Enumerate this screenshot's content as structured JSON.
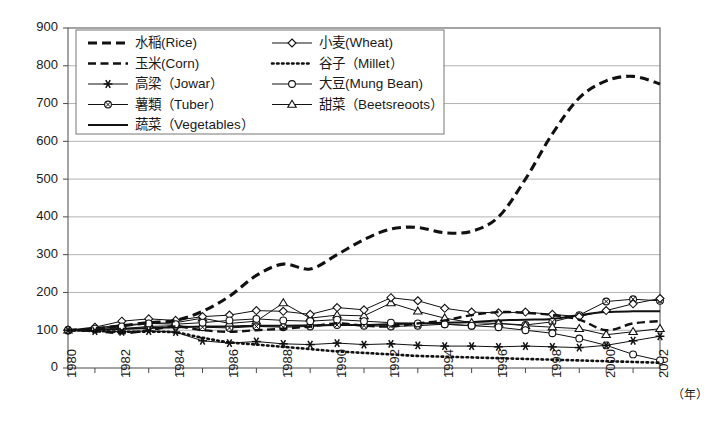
{
  "chart_data": {
    "type": "line",
    "title": "",
    "subtitle": "",
    "xlabel": "年",
    "ylabel": "",
    "xlim": [
      1980,
      2002
    ],
    "ylim": [
      0,
      900
    ],
    "grid": true,
    "legend_position": "top-left-inside",
    "x": [
      1980,
      1981,
      1982,
      1983,
      1984,
      1985,
      1986,
      1987,
      1988,
      1989,
      1990,
      1991,
      1992,
      1993,
      1994,
      1995,
      1996,
      1997,
      1998,
      1999,
      2000,
      2001,
      2002
    ],
    "x_tick_labels": [
      "1980",
      "1982",
      "1984",
      "1986",
      "1988",
      "1990",
      "1992",
      "1994",
      "1996",
      "1998",
      "2000",
      "2002"
    ],
    "y_tick_labels": [
      "0",
      "100",
      "200",
      "300",
      "400",
      "500",
      "600",
      "700",
      "800",
      "900"
    ],
    "series": [
      {
        "name": "水稲(Rice)",
        "key": "rice",
        "style": "dashed-thick",
        "marker": "none",
        "values": [
          100,
          104,
          112,
          120,
          126,
          150,
          190,
          245,
          275,
          262,
          300,
          340,
          368,
          372,
          358,
          362,
          400,
          500,
          620,
          715,
          760,
          772,
          752
        ]
      },
      {
        "name": "玉米(Corn)",
        "key": "corn",
        "style": "dashed-medium",
        "marker": "none",
        "values": [
          100,
          98,
          92,
          100,
          110,
          100,
          96,
          100,
          104,
          110,
          118,
          112,
          110,
          118,
          126,
          140,
          148,
          146,
          140,
          128,
          100,
          118,
          124
        ]
      },
      {
        "name": "高梁（Jowar）",
        "key": "jowar",
        "style": "solid-thin",
        "marker": "star",
        "values": [
          100,
          98,
          96,
          98,
          95,
          72,
          66,
          70,
          64,
          62,
          66,
          62,
          64,
          60,
          58,
          58,
          56,
          58,
          56,
          54,
          60,
          72,
          84
        ]
      },
      {
        "name": "薯類（Tuber）",
        "key": "tuber",
        "style": "solid-thin",
        "marker": "circle-x",
        "values": [
          100,
          102,
          104,
          110,
          112,
          108,
          106,
          110,
          108,
          110,
          114,
          112,
          110,
          112,
          116,
          112,
          118,
          114,
          122,
          140,
          176,
          182,
          178
        ]
      },
      {
        "name": "蔬菜（Vegetables）",
        "key": "vegetables",
        "style": "solid-medium",
        "marker": "none",
        "values": [
          100,
          101,
          103,
          106,
          108,
          110,
          110,
          112,
          112,
          113,
          114,
          114,
          116,
          118,
          120,
          122,
          126,
          128,
          130,
          140,
          148,
          150,
          150
        ]
      },
      {
        "name": "小麦(Wheat)",
        "key": "wheat",
        "style": "solid-thin",
        "marker": "diamond",
        "values": [
          100,
          108,
          124,
          130,
          126,
          136,
          140,
          152,
          150,
          142,
          160,
          154,
          186,
          178,
          158,
          148,
          146,
          148,
          142,
          136,
          152,
          170,
          184
        ]
      },
      {
        "name": "谷子（Millet）",
        "key": "millet",
        "style": "dotted",
        "marker": "none",
        "values": [
          100,
          98,
          96,
          96,
          94,
          80,
          68,
          62,
          56,
          50,
          44,
          40,
          36,
          32,
          30,
          28,
          26,
          24,
          22,
          20,
          18,
          16,
          14
        ]
      },
      {
        "name": "大豆(Mung Bean)",
        "key": "mungbean",
        "style": "solid-thin",
        "marker": "circle",
        "values": [
          100,
          104,
          110,
          118,
          116,
          120,
          126,
          130,
          126,
          124,
          128,
          124,
          120,
          118,
          116,
          112,
          108,
          100,
          92,
          78,
          60,
          36,
          20
        ]
      },
      {
        "name": "甜菜（Beetsreoots）",
        "key": "beetroots",
        "style": "solid-thin",
        "marker": "triangle",
        "values": [
          100,
          106,
          114,
          118,
          120,
          132,
          118,
          124,
          172,
          132,
          140,
          138,
          172,
          150,
          132,
          120,
          118,
          112,
          108,
          104,
          88,
          96,
          104
        ]
      }
    ]
  },
  "legend": {
    "entries": [
      {
        "label": "水稲(Rice)",
        "key": "rice"
      },
      {
        "label": "小麦(Wheat)",
        "key": "wheat"
      },
      {
        "label": "玉米(Corn)",
        "key": "corn"
      },
      {
        "label": "谷子（Millet）",
        "key": "millet"
      },
      {
        "label": "高梁（Jowar）",
        "key": "jowar"
      },
      {
        "label": "大豆(Mung Bean)",
        "key": "mungbean"
      },
      {
        "label": "薯類（Tuber）",
        "key": "tuber"
      },
      {
        "label": "甜菜（Beetsreoots）",
        "key": "beetroots"
      },
      {
        "label": "蔬菜（Vegetables）",
        "key": "vegetables"
      }
    ]
  },
  "axes": {
    "y_unit": "",
    "x_unit": "（年）"
  },
  "colors": {
    "ink": "#111111",
    "grid": "#a9a9a9",
    "frame": "#5a5a5a",
    "background": "#ffffff"
  }
}
